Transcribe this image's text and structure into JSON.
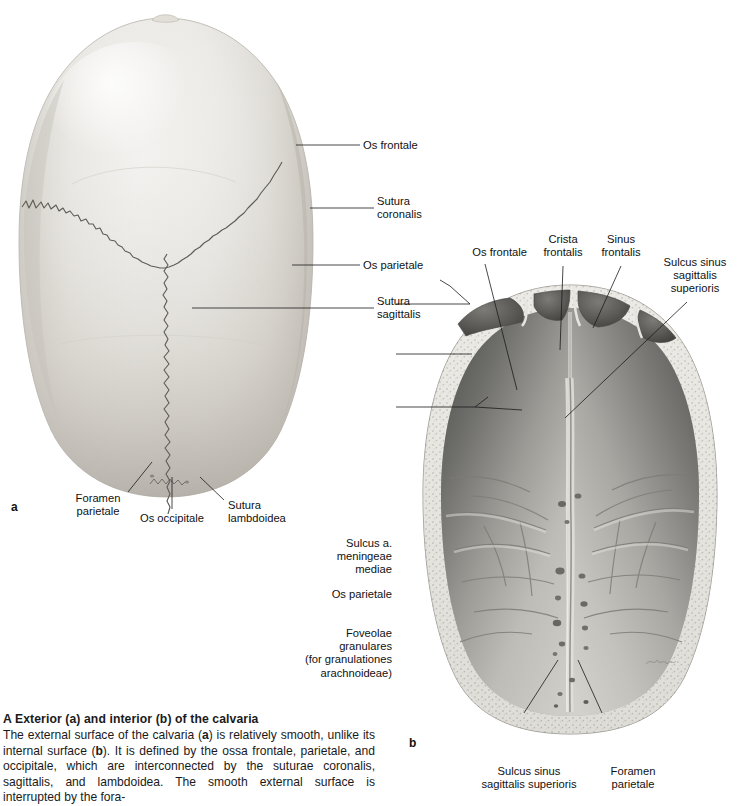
{
  "page": {
    "background": "#ffffff",
    "width": 739,
    "height": 791
  },
  "figure_a": {
    "letter": "a",
    "view": "Exterior (superior view) of the calvaria",
    "labels": [
      {
        "id": "os-frontale",
        "text": "Os frontale"
      },
      {
        "id": "sutura-coronalis",
        "text": "Sutura\ncoronalis"
      },
      {
        "id": "os-parietale",
        "text": "Os parietale"
      },
      {
        "id": "sutura-sagittalis",
        "text": "Sutura\nsagittalis"
      },
      {
        "id": "foramen-parietale",
        "text": "Foramen\nparietale"
      },
      {
        "id": "os-occipitale",
        "text": "Os occipitale"
      },
      {
        "id": "sutura-lambdoidea",
        "text": "Sutura\nlambdoidea"
      }
    ]
  },
  "figure_b": {
    "letter": "b",
    "view": "Interior (inferior view) of the calvaria",
    "labels": [
      {
        "id": "os-frontale-b",
        "text": "Os frontale"
      },
      {
        "id": "crista-frontalis",
        "text": "Crista\nfrontalis"
      },
      {
        "id": "sinus-frontalis",
        "text": "Sinus\nfrontalis"
      },
      {
        "id": "sulcus-sinus-sag-sup-top",
        "text": "Sulcus sinus\nsagittalis\nsuperioris"
      },
      {
        "id": "sulcus-a-meningeae-mediae",
        "text": "Sulcus a.\nmeningeae\nmediae"
      },
      {
        "id": "os-parietale-b",
        "text": "Os parietale"
      },
      {
        "id": "foveolae-granulares",
        "text": "Foveolae\ngranulares\n(for granulationes\narachnoideae)"
      },
      {
        "id": "sulcus-sinus-sag-sup-bottom",
        "text": "Sulcus sinus\nsagittalis superioris"
      },
      {
        "id": "foramen-parietale-b",
        "text": "Foramen\nparietale"
      }
    ]
  },
  "caption": {
    "heading": "A  Exterior (a) and interior (b) of the calvaria",
    "body_part1": "The external surface of the calvaria (",
    "body_b1": "a",
    "body_part2": ") is relatively smooth, unlike its internal surface (",
    "body_b2": "b",
    "body_part3": "). It is defined by the ossa frontale, parietale, and occipitale, which are interconnected by the suturae coronalis, sagittalis, and lambdoidea. The smooth external surface is interrupted by the fora-"
  },
  "colors": {
    "ink": "#1a1a1a",
    "bone_light": "#ededea",
    "bone_mid": "#d9d7d2",
    "bone_shadow": "#bdbab4",
    "interior_dark": "#5a5a58",
    "interior_mid": "#8e8d89",
    "interior_light": "#c9c7c2",
    "diploe": "#e6e4df",
    "suture": "#5b5852"
  }
}
